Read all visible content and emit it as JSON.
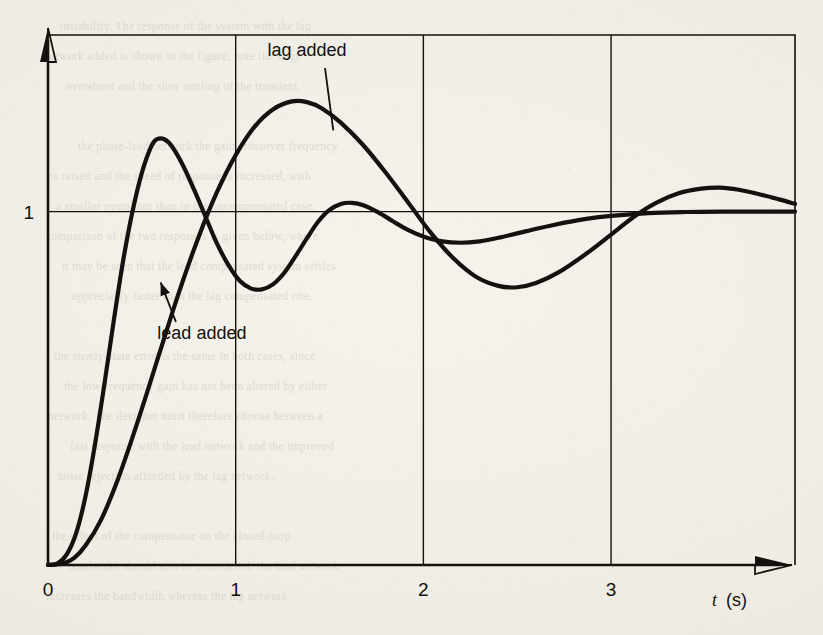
{
  "figure": {
    "background_color": "#f2f0e8",
    "ink_color": "#14110e",
    "ghost_lines": [
      "instability. The response of the system with the lag",
      "network added is shown in the figure; note the large",
      "overshoot and the slow settling of the transient.",
      "",
      "the phase-lead network the gain crossover frequency",
      "is raised and the speed of response is increased, with",
      "a smaller overshoot than in the uncompensated case.",
      "comparison of the two responses is given below, where",
      "it may be seen that the lead compensated system settles",
      "appreciably faster than the lag compensated one.",
      "",
      "the steady-state error is the same in both cases, since",
      "the low-frequency gain has not been altered by either",
      "network. The designer must therefore choose between a",
      "fast response with the lead network and the improved",
      "noise rejection afforded by the lag network.",
      "",
      "the effect of the compensator on the closed-loop",
      "bandwidth should also be considered: the lead network",
      "increases the bandwidth whereas the lag network"
    ]
  },
  "chart_data": {
    "type": "line",
    "title": "",
    "xlabel_symbol": "t",
    "xlabel_unit": "(s)",
    "ylabel": "",
    "xlim": [
      0,
      3.98
    ],
    "ylim": [
      0,
      1.5
    ],
    "x_ticks": [
      "0",
      "1",
      "2",
      "3"
    ],
    "x_tick_values": [
      0,
      1,
      2,
      3
    ],
    "y_ticks": [
      "1"
    ],
    "y_tick_values": [
      1
    ],
    "grid": "vertical gridlines at x = 1, 2, 3 and one horizontal reference line at y = 1",
    "legend_position": "inline annotations with leader lines",
    "annotations": [
      {
        "label": "lag added",
        "text_x": 1.38,
        "text_y": 1.44,
        "points_to_x": 1.52,
        "points_to_y": 1.23
      },
      {
        "label": "lead added",
        "text_x": 0.82,
        "text_y": 0.64,
        "points_to_x": 0.6,
        "points_to_y": 0.8
      }
    ],
    "series": [
      {
        "name": "lead added",
        "points": [
          [
            0.0,
            0.0
          ],
          [
            0.05,
            0.004
          ],
          [
            0.1,
            0.03
          ],
          [
            0.15,
            0.09
          ],
          [
            0.2,
            0.195
          ],
          [
            0.25,
            0.34
          ],
          [
            0.3,
            0.51
          ],
          [
            0.35,
            0.69
          ],
          [
            0.4,
            0.86
          ],
          [
            0.45,
            1.0
          ],
          [
            0.5,
            1.11
          ],
          [
            0.55,
            1.185
          ],
          [
            0.58,
            1.205
          ],
          [
            0.62,
            1.205
          ],
          [
            0.66,
            1.185
          ],
          [
            0.72,
            1.13
          ],
          [
            0.78,
            1.06
          ],
          [
            0.84,
            0.985
          ],
          [
            0.9,
            0.91
          ],
          [
            0.96,
            0.85
          ],
          [
            1.02,
            0.805
          ],
          [
            1.08,
            0.783
          ],
          [
            1.14,
            0.78
          ],
          [
            1.2,
            0.795
          ],
          [
            1.26,
            0.828
          ],
          [
            1.32,
            0.875
          ],
          [
            1.38,
            0.925
          ],
          [
            1.44,
            0.972
          ],
          [
            1.5,
            1.005
          ],
          [
            1.56,
            1.022
          ],
          [
            1.62,
            1.025
          ],
          [
            1.68,
            1.018
          ],
          [
            1.76,
            0.998
          ],
          [
            1.84,
            0.972
          ],
          [
            1.92,
            0.948
          ],
          [
            2.0,
            0.93
          ],
          [
            2.1,
            0.916
          ],
          [
            2.2,
            0.912
          ],
          [
            2.3,
            0.916
          ],
          [
            2.4,
            0.926
          ],
          [
            2.55,
            0.945
          ],
          [
            2.7,
            0.963
          ],
          [
            2.85,
            0.978
          ],
          [
            3.0,
            0.988
          ],
          [
            3.2,
            0.996
          ],
          [
            3.4,
            0.999
          ],
          [
            3.6,
            1.0
          ],
          [
            3.8,
            1.0
          ],
          [
            3.98,
            1.0
          ]
        ]
      },
      {
        "name": "lag added",
        "points": [
          [
            0.0,
            0.0
          ],
          [
            0.08,
            0.004
          ],
          [
            0.14,
            0.02
          ],
          [
            0.2,
            0.055
          ],
          [
            0.28,
            0.125
          ],
          [
            0.36,
            0.225
          ],
          [
            0.44,
            0.345
          ],
          [
            0.52,
            0.475
          ],
          [
            0.6,
            0.61
          ],
          [
            0.7,
            0.775
          ],
          [
            0.8,
            0.925
          ],
          [
            0.9,
            1.055
          ],
          [
            1.0,
            1.16
          ],
          [
            1.1,
            1.24
          ],
          [
            1.2,
            1.29
          ],
          [
            1.3,
            1.312
          ],
          [
            1.38,
            1.31
          ],
          [
            1.46,
            1.292
          ],
          [
            1.56,
            1.252
          ],
          [
            1.68,
            1.188
          ],
          [
            1.8,
            1.11
          ],
          [
            1.92,
            1.025
          ],
          [
            2.04,
            0.94
          ],
          [
            2.16,
            0.868
          ],
          [
            2.28,
            0.816
          ],
          [
            2.4,
            0.79
          ],
          [
            2.5,
            0.786
          ],
          [
            2.6,
            0.798
          ],
          [
            2.72,
            0.828
          ],
          [
            2.86,
            0.878
          ],
          [
            3.0,
            0.935
          ],
          [
            3.12,
            0.985
          ],
          [
            3.24,
            1.025
          ],
          [
            3.36,
            1.052
          ],
          [
            3.48,
            1.065
          ],
          [
            3.58,
            1.068
          ],
          [
            3.68,
            1.062
          ],
          [
            3.8,
            1.048
          ],
          [
            3.9,
            1.034
          ],
          [
            3.98,
            1.022
          ]
        ]
      }
    ]
  }
}
